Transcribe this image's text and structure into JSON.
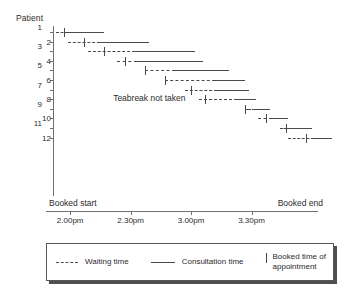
{
  "chart_data": {
    "type": "bar",
    "title": "",
    "ylabel": "Patient",
    "xlabel": "",
    "grid": false,
    "legend_position": "bottom",
    "x_axis": {
      "tick_labels": [
        "2.00pm",
        "2.30pm",
        "3.00pm",
        "3.30pm"
      ],
      "tick_values": [
        120,
        150,
        180,
        210
      ],
      "range_minutes": [
        108,
        243
      ],
      "left_marker": "Booked start",
      "right_marker": "Booked end"
    },
    "y_axis": {
      "tick_labels": [
        "1",
        "2",
        "3",
        "4",
        "5",
        "6",
        "7",
        "8",
        "9",
        "10",
        "11",
        "12"
      ],
      "range": [
        1,
        12
      ]
    },
    "annotations": [
      {
        "text": "Teabreak not taken",
        "patient": 8
      }
    ],
    "series": [
      {
        "name": "Waiting time",
        "style": "dashed"
      },
      {
        "name": "Consultation time",
        "style": "solid"
      },
      {
        "name": "Booked time of appointment",
        "style": "tick"
      }
    ],
    "patients": [
      {
        "patient": "1",
        "waiting_start": 113,
        "booked_time": 117,
        "consultation_start": 119,
        "consultation_end": 137
      },
      {
        "patient": "2",
        "waiting_start": 119,
        "booked_time": 127,
        "consultation_start": 135,
        "consultation_end": 159
      },
      {
        "patient": "3",
        "waiting_start": 129,
        "booked_time": 137,
        "consultation_start": 152,
        "consultation_end": 182
      },
      {
        "patient": "4",
        "waiting_start": 143,
        "booked_time": 147,
        "consultation_start": 153,
        "consultation_end": 186
      },
      {
        "patient": "5",
        "waiting_start": 157,
        "booked_time": 157,
        "consultation_start": 172,
        "consultation_end": 199
      },
      {
        "patient": "6",
        "waiting_start": 167,
        "booked_time": 167,
        "consultation_start": 192,
        "consultation_end": 207
      },
      {
        "patient": "7",
        "waiting_start": 177,
        "booked_time": 180,
        "consultation_start": 193,
        "consultation_end": 209
      },
      {
        "patient": "8",
        "waiting_start": 184,
        "booked_time": 187,
        "consultation_start": 203,
        "consultation_end": 212
      },
      {
        "patient": "9",
        "waiting_start": 207,
        "booked_time": 207,
        "consultation_start": 210,
        "consultation_end": 219
      },
      {
        "patient": "10",
        "waiting_start": 213,
        "booked_time": 217,
        "consultation_start": 220,
        "consultation_end": 228
      },
      {
        "patient": "11",
        "waiting_start": 224,
        "booked_time": 227,
        "consultation_start": 229,
        "consultation_end": 240
      },
      {
        "patient": "12",
        "waiting_start": 228,
        "booked_time": 237,
        "consultation_start": 241,
        "consultation_end": 250
      }
    ]
  },
  "legend": {
    "items": [
      {
        "label": "Waiting time",
        "style": "dashed"
      },
      {
        "label": "Consultation time",
        "style": "solid"
      },
      {
        "label": "Booked time of appointment",
        "style": "tick"
      }
    ]
  }
}
